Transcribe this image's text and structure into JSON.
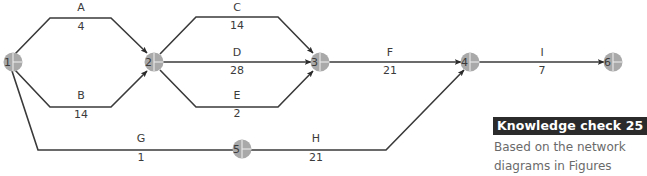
{
  "diagram": {
    "type": "activity-on-arrow network",
    "nodes": [
      {
        "id": "1",
        "label": "1",
        "x": 13,
        "y": 62
      },
      {
        "id": "2",
        "label": "2",
        "x": 154,
        "y": 62
      },
      {
        "id": "3",
        "label": "3",
        "x": 320,
        "y": 62
      },
      {
        "id": "4",
        "label": "4",
        "x": 470,
        "y": 62
      },
      {
        "id": "5",
        "label": "5",
        "x": 242,
        "y": 149
      },
      {
        "id": "6",
        "label": "6",
        "x": 613,
        "y": 62
      }
    ],
    "activities": [
      {
        "name": "A",
        "duration": "4",
        "from": "1",
        "to": "2"
      },
      {
        "name": "B",
        "duration": "14",
        "from": "1",
        "to": "2"
      },
      {
        "name": "C",
        "duration": "14",
        "from": "2",
        "to": "3"
      },
      {
        "name": "D",
        "duration": "28",
        "from": "2",
        "to": "3"
      },
      {
        "name": "E",
        "duration": "2",
        "from": "2",
        "to": "3"
      },
      {
        "name": "F",
        "duration": "21",
        "from": "3",
        "to": "4"
      },
      {
        "name": "G",
        "duration": "1",
        "from": "1",
        "to": "5"
      },
      {
        "name": "H",
        "duration": "21",
        "from": "5",
        "to": "4"
      },
      {
        "name": "I",
        "duration": "7",
        "from": "4",
        "to": "6"
      }
    ]
  },
  "knowledge_check": {
    "title": "Knowledge check 25",
    "text": "Based on the network diagrams in Figures"
  },
  "colors": {
    "node_fill": "#a9a9a9",
    "edge": "#3a3a3a",
    "title_bg": "#2b2b2b",
    "body_text": "#6a6a6a"
  }
}
